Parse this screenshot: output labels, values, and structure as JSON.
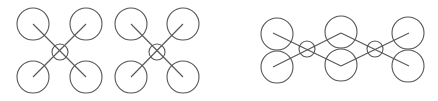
{
  "diagram": {
    "stroke_color": "#555555",
    "background": "#ffffff",
    "figures": [
      {
        "name": "quad-x-frame-1",
        "rotor_radius": 16,
        "hub_radius": 8,
        "hub": [
          60,
          52
        ],
        "rotors": [
          [
            33,
            24
          ],
          [
            86,
            24
          ],
          [
            33,
            77
          ],
          [
            86,
            77
          ]
        ],
        "arms": [
          [
            [
              33,
              24
            ],
            [
              86,
              77
            ]
          ],
          [
            [
              86,
              24
            ],
            [
              33,
              77
            ]
          ]
        ]
      },
      {
        "name": "quad-x-frame-2",
        "rotor_radius": 16,
        "hub_radius": 8,
        "hub": [
          157,
          52
        ],
        "rotors": [
          [
            131,
            24
          ],
          [
            183,
            24
          ],
          [
            131,
            77
          ],
          [
            183,
            77
          ]
        ],
        "arms": [
          [
            [
              131,
              24
            ],
            [
              183,
              77
            ]
          ],
          [
            [
              183,
              24
            ],
            [
              131,
              77
            ]
          ]
        ]
      },
      {
        "name": "hexa-coaxial-chain",
        "rotor_radius": 16,
        "hub_radius": 8,
        "hubs": [
          [
            307,
            49
          ],
          [
            375,
            49
          ]
        ],
        "rotors": [
          [
            277,
            34
          ],
          [
            277,
            67
          ],
          [
            341,
            32
          ],
          [
            341,
            65
          ],
          [
            408,
            33
          ],
          [
            408,
            66
          ]
        ],
        "arms": [
          [
            [
              273,
              33
            ],
            [
              341,
              66
            ]
          ],
          [
            [
              273,
              67
            ],
            [
              341,
              33
            ]
          ],
          [
            [
              341,
              33
            ],
            [
              409,
              66
            ]
          ],
          [
            [
              341,
              66
            ],
            [
              409,
              33
            ]
          ]
        ]
      }
    ]
  }
}
